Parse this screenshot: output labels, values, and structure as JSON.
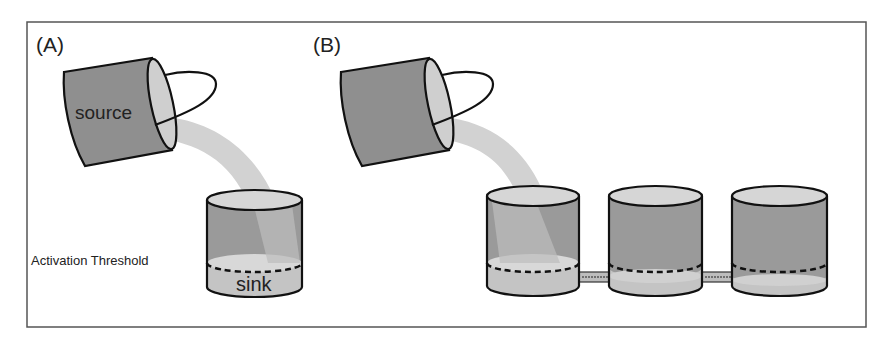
{
  "panels": {
    "a": {
      "label": "(A)",
      "source_label": "source",
      "sink_label": "sink",
      "threshold_label": "Activation Threshold"
    },
    "b": {
      "label": "(B)",
      "tank_count": 3,
      "connections": [
        "tank-1 to tank-2",
        "tank-2 to tank-3"
      ]
    }
  },
  "colors": {
    "bucket_body": "#8f8f8f",
    "bucket_rim": "#cfcfcf",
    "stream": "#d2d2d2",
    "tank_upper": "#9a9a9a",
    "tank_liquid": "#c4c4c4",
    "tank_top": "#d6d6d6",
    "outline": "#111111",
    "frame": "#555555"
  }
}
